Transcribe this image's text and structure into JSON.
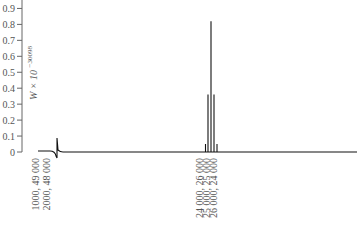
{
  "chart_data": {
    "type": "line",
    "title": "",
    "xlabel": "",
    "ylabel": "W × 10",
    "ylabel_exponent": "−30098",
    "ylim": [
      0,
      0.9
    ],
    "y_ticks": [
      "0",
      "0.1",
      "0.2",
      "0.3",
      "0.4",
      "0.5",
      "0.6",
      "0.7",
      "0.8",
      "0.9"
    ],
    "x_tick_labels": [
      "1000, 49 000",
      "2000, 48 000",
      "24 000, 26 000",
      "25 000, 25 000",
      "26 000, 24 000"
    ],
    "grid": false,
    "legend": null,
    "series": [
      {
        "name": "W",
        "description": "Near-zero everywhere except a small transient near the left and a sharp cluster of spikes around 25 000, 25 000",
        "spikes": [
          {
            "x_label": "24 000, 26 000 (left)",
            "value": 0.05
          },
          {
            "x_label": "24 000, 26 000",
            "value": 0.36
          },
          {
            "x_label": "25 000, 25 000",
            "value": 0.82
          },
          {
            "x_label": "26 000, 24 000",
            "value": 0.36
          },
          {
            "x_label": "26 000, 24 000 (right)",
            "value": 0.05
          }
        ]
      }
    ],
    "line_color": "#111111"
  }
}
